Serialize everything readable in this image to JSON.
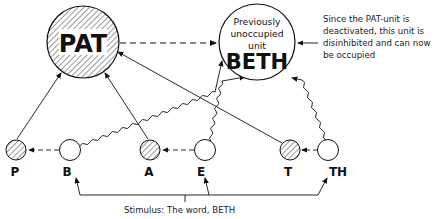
{
  "diagram": {
    "top_units": [
      {
        "id": "pat",
        "label": "PAT",
        "state": "deactivated",
        "hatched": true
      },
      {
        "id": "beth",
        "lines": [
          "Previously",
          "unoccupied",
          "unit"
        ],
        "label": "BETH",
        "hatched": false
      }
    ],
    "letter_units": [
      {
        "id": "p",
        "label": "P",
        "hatched": true
      },
      {
        "id": "b",
        "label": "B",
        "hatched": false
      },
      {
        "id": "a",
        "label": "A",
        "hatched": true
      },
      {
        "id": "e",
        "label": "E",
        "hatched": false
      },
      {
        "id": "t",
        "label": "T",
        "hatched": true
      },
      {
        "id": "th",
        "label": "TH",
        "hatched": false
      }
    ],
    "annotation": "Since the PAT-unit is deactivated, this unit is disinhibited and can now be occupied",
    "stimulus": "Stimulus: The word, BETH",
    "edges": [
      {
        "from": "pat",
        "to": "beth",
        "style": "dashed"
      },
      {
        "from": "p",
        "to": "pat",
        "style": "solid"
      },
      {
        "from": "a",
        "to": "pat",
        "style": "solid"
      },
      {
        "from": "t",
        "to": "pat",
        "style": "solid"
      },
      {
        "from": "b",
        "to": "beth",
        "style": "wavy"
      },
      {
        "from": "e",
        "to": "beth",
        "style": "wavy"
      },
      {
        "from": "th",
        "to": "beth",
        "style": "wavy"
      },
      {
        "from": "b",
        "to": "p",
        "style": "dashed"
      },
      {
        "from": "e",
        "to": "a",
        "style": "dashed"
      },
      {
        "from": "th",
        "to": "t",
        "style": "dashed"
      },
      {
        "from": "stimulus",
        "to": "b",
        "style": "solid"
      },
      {
        "from": "stimulus",
        "to": "e",
        "style": "solid"
      },
      {
        "from": "stimulus",
        "to": "th",
        "style": "solid"
      }
    ]
  }
}
